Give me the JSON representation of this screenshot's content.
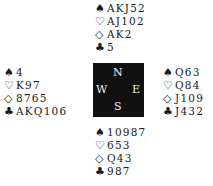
{
  "deal": {
    "north": {
      "spades": "AKJ52",
      "hearts": "AJ102",
      "diamonds": "AK2",
      "clubs": "5"
    },
    "west": {
      "spades": "4",
      "hearts": "K97",
      "diamonds": "8765",
      "clubs": "AKQ106"
    },
    "east": {
      "spades": "Q63",
      "hearts": "Q84",
      "diamonds": "J109",
      "clubs": "J432"
    },
    "south": {
      "spades": "10987",
      "hearts": "653",
      "diamonds": "Q43",
      "clubs": "987"
    }
  },
  "suit_symbols": {
    "spades": "♠",
    "hearts": "♡",
    "diamonds": "◇",
    "clubs": "♣"
  },
  "compass": {
    "north": "N",
    "east": "E",
    "south": "S",
    "west": "W"
  }
}
